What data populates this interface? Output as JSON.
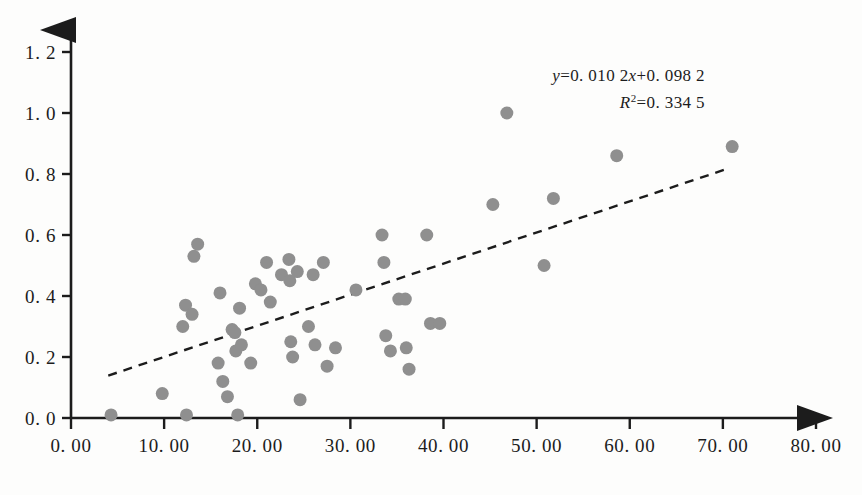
{
  "chart_data": {
    "type": "scatter",
    "title": "",
    "subtitle": "",
    "xlabel": "",
    "ylabel": "",
    "xlim": [
      0,
      80
    ],
    "ylim": [
      0,
      1.2
    ],
    "grid": false,
    "legend": "none",
    "x_ticks": [
      "0. 00",
      "10. 00",
      "20. 00",
      "30. 00",
      "40. 00",
      "50. 00",
      "60. 00",
      "70. 00",
      "80. 00"
    ],
    "x_tick_values": [
      0,
      10,
      20,
      30,
      40,
      50,
      60,
      70,
      80
    ],
    "y_ticks": [
      "0. 0",
      "0. 2",
      "0. 4",
      "0. 6",
      "0. 8",
      "1. 0",
      "1. 2"
    ],
    "y_tick_values": [
      0.0,
      0.2,
      0.4,
      0.6,
      0.8,
      1.0,
      1.2
    ],
    "marker": {
      "shape": "circle",
      "color": "#8f8f8f",
      "size": 13
    },
    "points": [
      {
        "x": 4.3,
        "y": 0.01
      },
      {
        "x": 9.8,
        "y": 0.08
      },
      {
        "x": 12.4,
        "y": 0.01
      },
      {
        "x": 12.0,
        "y": 0.3
      },
      {
        "x": 12.3,
        "y": 0.37
      },
      {
        "x": 13.0,
        "y": 0.34
      },
      {
        "x": 13.2,
        "y": 0.53
      },
      {
        "x": 13.6,
        "y": 0.57
      },
      {
        "x": 15.8,
        "y": 0.18
      },
      {
        "x": 16.0,
        "y": 0.41
      },
      {
        "x": 16.3,
        "y": 0.12
      },
      {
        "x": 16.8,
        "y": 0.07
      },
      {
        "x": 17.3,
        "y": 0.29
      },
      {
        "x": 17.6,
        "y": 0.28
      },
      {
        "x": 17.7,
        "y": 0.22
      },
      {
        "x": 17.9,
        "y": 0.01
      },
      {
        "x": 18.1,
        "y": 0.36
      },
      {
        "x": 18.3,
        "y": 0.24
      },
      {
        "x": 19.3,
        "y": 0.18
      },
      {
        "x": 19.8,
        "y": 0.44
      },
      {
        "x": 20.4,
        "y": 0.42
      },
      {
        "x": 21.0,
        "y": 0.51
      },
      {
        "x": 21.4,
        "y": 0.38
      },
      {
        "x": 22.6,
        "y": 0.47
      },
      {
        "x": 23.4,
        "y": 0.52
      },
      {
        "x": 23.5,
        "y": 0.45
      },
      {
        "x": 23.6,
        "y": 0.25
      },
      {
        "x": 23.8,
        "y": 0.2
      },
      {
        "x": 24.3,
        "y": 0.48
      },
      {
        "x": 24.6,
        "y": 0.06
      },
      {
        "x": 25.5,
        "y": 0.3
      },
      {
        "x": 26.0,
        "y": 0.47
      },
      {
        "x": 26.2,
        "y": 0.24
      },
      {
        "x": 27.1,
        "y": 0.51
      },
      {
        "x": 27.5,
        "y": 0.17
      },
      {
        "x": 28.4,
        "y": 0.23
      },
      {
        "x": 30.6,
        "y": 0.42
      },
      {
        "x": 33.4,
        "y": 0.6
      },
      {
        "x": 33.6,
        "y": 0.51
      },
      {
        "x": 33.8,
        "y": 0.27
      },
      {
        "x": 34.3,
        "y": 0.22
      },
      {
        "x": 35.2,
        "y": 0.39
      },
      {
        "x": 35.9,
        "y": 0.39
      },
      {
        "x": 36.0,
        "y": 0.23
      },
      {
        "x": 36.3,
        "y": 0.16
      },
      {
        "x": 38.2,
        "y": 0.6
      },
      {
        "x": 38.6,
        "y": 0.31
      },
      {
        "x": 39.6,
        "y": 0.31
      },
      {
        "x": 45.3,
        "y": 0.7
      },
      {
        "x": 46.8,
        "y": 1.0
      },
      {
        "x": 50.8,
        "y": 0.5
      },
      {
        "x": 51.8,
        "y": 0.72
      },
      {
        "x": 58.6,
        "y": 0.86
      },
      {
        "x": 71.0,
        "y": 0.89
      }
    ],
    "trendline": {
      "style": "dashed",
      "color": "#1c1c1c",
      "x_start": 4.0,
      "x_end": 70.3,
      "slope": 0.0102,
      "intercept": 0.0982
    },
    "annotations": {
      "equation_y": "y",
      "equation_body": "=0. 010 2",
      "equation_x": "x",
      "equation_tail": "+0. 098 2",
      "r_squared_symbol": "R",
      "r_squared_exp": "2",
      "r_squared_value": "=0. 334 5",
      "equation_full": "y=0. 010 2x+0. 098 2",
      "r_squared_full": "R2=0. 334 5"
    }
  },
  "axes": {
    "x_axis_name": "x-axis",
    "y_axis_name": "y-axis",
    "arrow_heads": true,
    "axis_color": "#1c1c1c"
  }
}
